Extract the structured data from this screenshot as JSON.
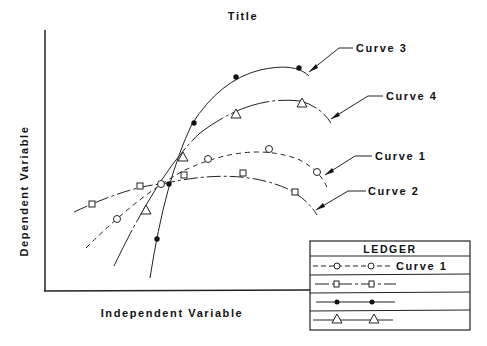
{
  "title": "Title",
  "xlabel": "Independent Variable",
  "ylabel": "Dependent Variable",
  "legend": {
    "title": "LEDGER",
    "rows": [
      {
        "curve": "Curve 1",
        "line_style": "dashed",
        "marker": "circle",
        "label": "Curve 1"
      },
      {
        "curve": "Curve 2",
        "line_style": "dash-dot",
        "marker": "square",
        "label": ""
      },
      {
        "curve": "Curve 3",
        "line_style": "solid",
        "marker": "filled-circle",
        "label": ""
      },
      {
        "curve": "Curve 4",
        "line_style": "solid",
        "marker": "triangle",
        "label": ""
      }
    ]
  },
  "curves": [
    {
      "name": "Curve 1",
      "callout": "Curve 1",
      "line_style": "dashed",
      "marker": "circle"
    },
    {
      "name": "Curve 2",
      "callout": "Curve 2",
      "line_style": "dash-dot",
      "marker": "square"
    },
    {
      "name": "Curve 3",
      "callout": "Curve 3",
      "line_style": "solid",
      "marker": "filled-circle"
    },
    {
      "name": "Curve 4",
      "callout": "Curve 4",
      "line_style": "dash-dot",
      "marker": "triangle"
    }
  ],
  "colors": {
    "ink": "#111111",
    "background": "#ffffff"
  }
}
